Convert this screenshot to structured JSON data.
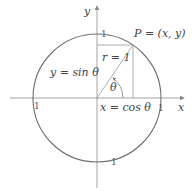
{
  "diagram": {
    "colors": {
      "circle": "#6e6e6e",
      "axes": "#8a8a8a",
      "lines": "#9a9a9a",
      "text": "#444444"
    },
    "axes": {
      "x_label": "x",
      "y_label": "y"
    },
    "point_label": "P = (x, y)",
    "radius_label": "r = 1",
    "angle_label": "θ",
    "sin_label": "y = sin θ",
    "cos_label": "x = cos θ",
    "ticks": {
      "top": "1",
      "right": "1",
      "left": "1",
      "bottom": "1"
    }
  }
}
